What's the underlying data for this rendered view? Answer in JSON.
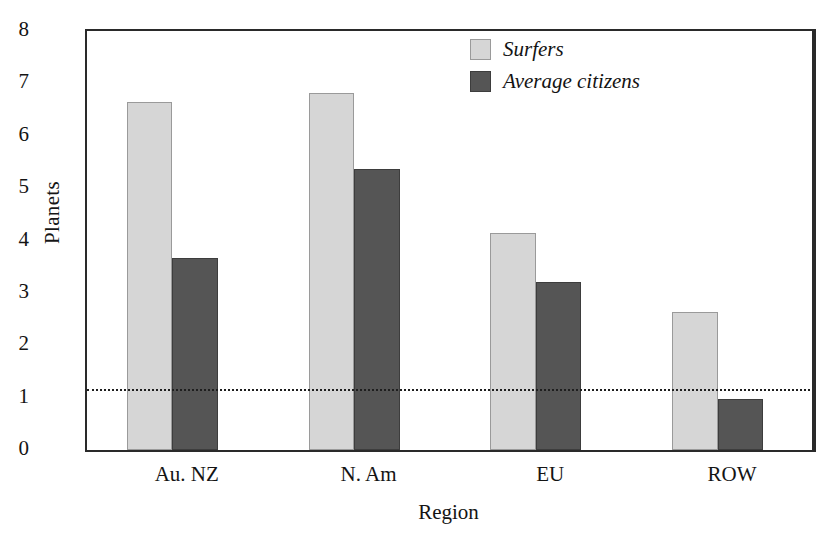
{
  "chart_data": {
    "type": "bar",
    "title": "",
    "xlabel": "Region",
    "ylabel": "Planets",
    "categories": [
      "Au. NZ",
      "N. Am",
      "EU",
      "ROW"
    ],
    "ylim": [
      0,
      8
    ],
    "yticks": [
      8,
      7,
      6,
      5,
      4,
      3,
      2,
      1,
      0
    ],
    "grid": false,
    "legend_position": "top-right",
    "series": [
      {
        "name": "Surfers",
        "color": "#d6d6d6",
        "values": [
          6.65,
          6.82,
          4.15,
          2.63
        ]
      },
      {
        "name": "Average citizens",
        "color": "#555555",
        "values": [
          3.67,
          5.37,
          3.2,
          0.97
        ]
      }
    ],
    "annotations": [
      {
        "type": "hline",
        "value": 1.13,
        "style": "dotted",
        "color": "#1e1e1e"
      }
    ]
  },
  "legend": {
    "items": [
      {
        "label": "Surfers",
        "swatch": "light-gray-swatch"
      },
      {
        "label": "Average citizens",
        "swatch": "dark-gray-swatch"
      }
    ]
  }
}
